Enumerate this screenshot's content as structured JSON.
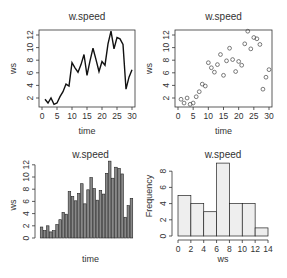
{
  "chart_data": [
    {
      "type": "line",
      "title": "w.speed",
      "xlabel": "time",
      "ylabel": "ws",
      "x": [
        1,
        2,
        3,
        4,
        5,
        6,
        7,
        8,
        9,
        10,
        11,
        12,
        13,
        14,
        15,
        16,
        17,
        18,
        19,
        20,
        21,
        22,
        23,
        24,
        25,
        26,
        27,
        28,
        29,
        30
      ],
      "values": [
        1.8,
        1.2,
        2.0,
        1.0,
        1.2,
        2.2,
        3.0,
        4.2,
        3.9,
        7.6,
        6.8,
        6.1,
        7.3,
        8.9,
        5.6,
        7.9,
        9.9,
        8.1,
        6.2,
        7.8,
        7.2,
        10.6,
        12.6,
        9.8,
        11.6,
        11.4,
        10.5,
        3.4,
        5.3,
        6.5
      ],
      "xticks": [
        "0",
        "5",
        "10",
        "15",
        "20",
        "25",
        "30"
      ],
      "yticks": [
        "2",
        "4",
        "6",
        "8",
        "10",
        "12"
      ],
      "xlim": [
        0,
        30
      ],
      "ylim": [
        1,
        12.6
      ]
    },
    {
      "type": "scatter",
      "title": "w.speed",
      "xlabel": "time",
      "ylabel": "ws",
      "x": [
        1,
        2,
        3,
        4,
        5,
        6,
        7,
        8,
        9,
        10,
        11,
        12,
        13,
        14,
        15,
        16,
        17,
        18,
        19,
        20,
        21,
        22,
        23,
        24,
        25,
        26,
        27,
        28,
        29,
        30
      ],
      "values": [
        1.8,
        1.2,
        2.0,
        1.0,
        1.2,
        2.2,
        3.0,
        4.2,
        3.9,
        7.6,
        6.8,
        6.1,
        7.3,
        8.9,
        5.6,
        7.9,
        9.9,
        8.1,
        6.2,
        7.8,
        7.2,
        10.6,
        12.6,
        9.8,
        11.6,
        11.4,
        10.5,
        3.4,
        5.3,
        6.5
      ],
      "xticks": [
        "0",
        "5",
        "10",
        "15",
        "20",
        "25",
        "30"
      ],
      "yticks": [
        "2",
        "4",
        "6",
        "8",
        "10",
        "12"
      ],
      "xlim": [
        0,
        30
      ],
      "ylim": [
        1,
        12.6
      ]
    },
    {
      "type": "bar",
      "title": "w.speed",
      "xlabel": "time",
      "ylabel": "ws",
      "categories": [
        1,
        2,
        3,
        4,
        5,
        6,
        7,
        8,
        9,
        10,
        11,
        12,
        13,
        14,
        15,
        16,
        17,
        18,
        19,
        20,
        21,
        22,
        23,
        24,
        25,
        26,
        27,
        28,
        29,
        30
      ],
      "values": [
        1.8,
        1.2,
        2.0,
        1.0,
        1.2,
        2.2,
        3.0,
        4.2,
        3.9,
        7.6,
        6.8,
        6.1,
        7.3,
        8.9,
        5.6,
        7.9,
        9.9,
        8.1,
        6.2,
        7.8,
        7.2,
        10.6,
        12.6,
        9.8,
        11.6,
        11.4,
        10.5,
        3.4,
        5.3,
        6.5
      ],
      "yticks": [
        "0",
        "2",
        "4",
        "6",
        "8",
        "10",
        "12"
      ],
      "ylim": [
        0,
        12.6
      ]
    },
    {
      "type": "bar",
      "subtype": "histogram",
      "title": "w.speed",
      "xlabel": "ws",
      "ylabel": "Frequency",
      "bins": [
        [
          0,
          2
        ],
        [
          2,
          4
        ],
        [
          4,
          6
        ],
        [
          6,
          8
        ],
        [
          8,
          10
        ],
        [
          10,
          12
        ],
        [
          12,
          14
        ]
      ],
      "values": [
        5,
        4,
        3,
        9,
        4,
        4,
        1
      ],
      "xticks": [
        "0",
        "2",
        "4",
        "6",
        "8",
        "10",
        "12",
        "14"
      ],
      "yticks": [
        "0",
        "2",
        "4",
        "6",
        "8"
      ],
      "xlim": [
        0,
        14
      ],
      "ylim": [
        0,
        9
      ]
    }
  ],
  "colors": {
    "axis": "#333333",
    "line": "#111111",
    "bar_fill": "#888888",
    "bar_stroke": "#222222",
    "hist_fill": "#eeeeee",
    "point_stroke": "#444444"
  }
}
